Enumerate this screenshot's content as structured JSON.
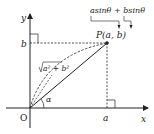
{
  "diagram": {
    "axes": {
      "x_label": "x",
      "y_label": "y",
      "origin_label": "O"
    },
    "point": {
      "label": "P(a, b)",
      "x_label": "a",
      "y_label": "b"
    },
    "hypotenuse_label": "√(a²+b²)",
    "hypotenuse_radicand": "a² + b²",
    "angle_label": "α",
    "expression": "asinθ + bsinθ",
    "colors": {
      "stroke": "#222222",
      "background": "#ffffff"
    }
  }
}
